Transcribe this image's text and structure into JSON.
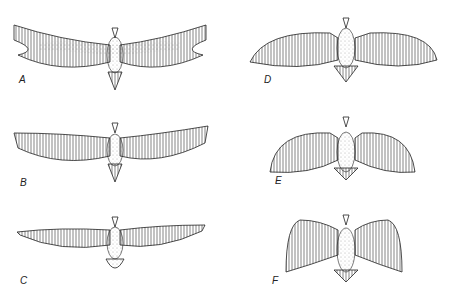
{
  "figure": {
    "colors": {
      "ink": "#222222",
      "background": "#ffffff"
    },
    "panels": [
      {
        "label": "A",
        "wing_type": "long narrow, slotted tips"
      },
      {
        "label": "B",
        "wing_type": "long narrow, slotted tips"
      },
      {
        "label": "C",
        "wing_type": "long narrow, pointed"
      },
      {
        "label": "D",
        "wing_type": "broad, rounded"
      },
      {
        "label": "E",
        "wing_type": "broad, swept"
      },
      {
        "label": "F",
        "wing_type": "short broad, raised"
      }
    ]
  }
}
